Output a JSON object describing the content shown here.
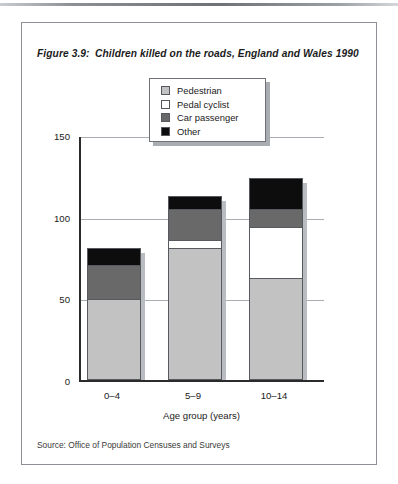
{
  "figure": {
    "number": "Figure 3.9:",
    "title": "Children killed on the roads, England and Wales 1990",
    "source": "Source: Office of Population Censuses and Surveys"
  },
  "legend": {
    "position": "top-center",
    "entries": [
      {
        "label": "Pedestrian",
        "color": "#c2c2c2",
        "icon": "legend-swatch-icon"
      },
      {
        "label": "Pedal cyclist",
        "color": "#ffffff",
        "icon": "legend-swatch-icon"
      },
      {
        "label": "Car passenger",
        "color": "#696969",
        "icon": "legend-swatch-icon"
      },
      {
        "label": "Other",
        "color": "#0d0d0d",
        "icon": "legend-swatch-icon"
      }
    ]
  },
  "chart_data": {
    "type": "bar",
    "subtype": "stacked",
    "title": "Children killed on the roads, England and Wales 1990",
    "xlabel": "Age group (years)",
    "ylabel": "Number of deaths",
    "categories": [
      "0–4",
      "5–9",
      "10–14"
    ],
    "ylim": [
      0,
      150
    ],
    "yticks": [
      0,
      50,
      100,
      150
    ],
    "yticklabels": [
      "0",
      "50",
      "100",
      "150"
    ],
    "grid": true,
    "legend_position": "top-center",
    "series": [
      {
        "name": "Pedestrian",
        "color": "#c2c2c2",
        "values": [
          49,
          80,
          62
        ]
      },
      {
        "name": "Pedal cyclist",
        "color": "#ffffff",
        "values": [
          0,
          5,
          31
        ]
      },
      {
        "name": "Car passenger",
        "color": "#696969",
        "values": [
          21,
          19,
          11
        ]
      },
      {
        "name": "Other",
        "color": "#0d0d0d",
        "values": [
          10,
          8,
          19
        ]
      }
    ],
    "totals": [
      80,
      112,
      123
    ]
  }
}
